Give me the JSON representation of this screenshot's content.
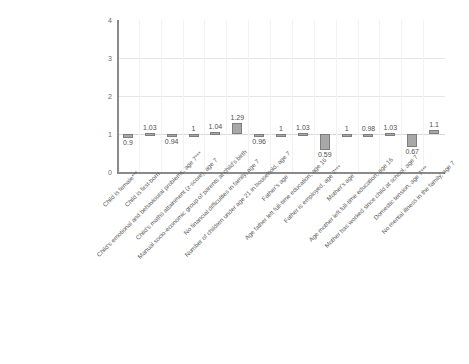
{
  "chart_data": {
    "type": "bar",
    "title": "",
    "subtitle": "",
    "xlabel": "",
    "ylabel": "",
    "ylim": [
      0,
      4
    ],
    "yticks": [
      "0",
      "1",
      "2",
      "3",
      "4"
    ],
    "grid": "horizontal-and-vertical-light",
    "legend": "none",
    "reference_line": 1,
    "bar_color": "#a8a8a8",
    "bar_edge_color": "#7d7d7d",
    "categories": [
      "Child is female***",
      "Child is first-born",
      "Child's emotional and behavioural problems, age 7***",
      "Child's maths attainment (z-score), age 7",
      "Manual socio-economic group of parents at child's birth",
      "No financial difficulties in family, age 7",
      "Number of children under age 21 in household, age 7",
      "Father's age",
      "Age father left full-time education, age 16",
      "Father is employed, age 7***",
      "Mother's age",
      "Age mother left full-time education, age 16",
      "Mother has worked since child at school, age 7",
      "Domestic tension, age 7***",
      "No mental illness in the family, age 7"
    ],
    "values": [
      0.9,
      1.03,
      0.94,
      1,
      1.04,
      1.29,
      0.96,
      1,
      1.03,
      0.59,
      1,
      0.98,
      1.03,
      0.67,
      1.1
    ],
    "value_labels": [
      "0.9",
      "1.03",
      "0.94",
      "1",
      "1.04",
      "1.29",
      "0.96",
      "1",
      "1.03",
      "0.59",
      "1",
      "0.98",
      "1.03",
      "0.67",
      "1.1"
    ],
    "label_positions": [
      "below",
      "above",
      "below",
      "above",
      "above",
      "above",
      "below",
      "above",
      "above",
      "below",
      "above",
      "above",
      "above",
      "below",
      "above"
    ]
  }
}
